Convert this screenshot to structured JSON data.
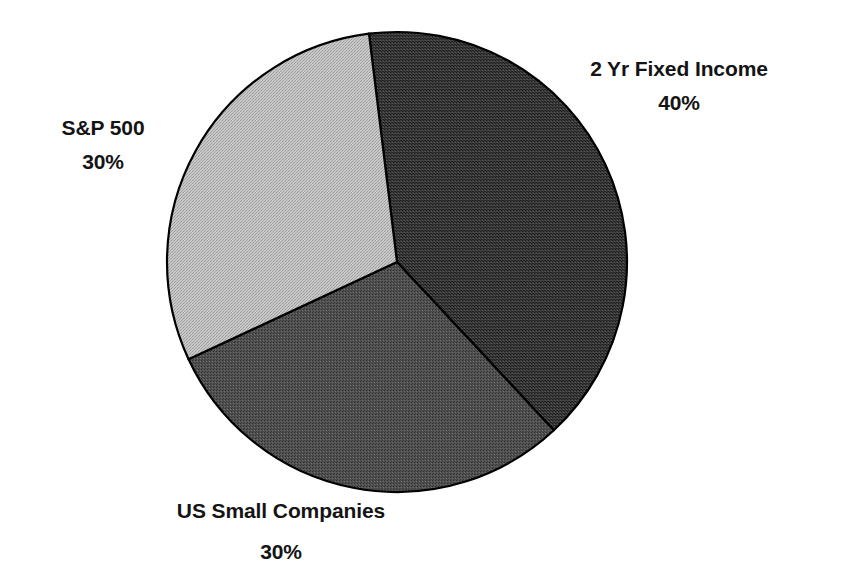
{
  "chart_data": {
    "type": "pie",
    "title": "",
    "subtitle": "",
    "xlabel": "",
    "ylabel": "",
    "legend_position": "none",
    "grid": false,
    "labels_outside": true,
    "units": "percent",
    "total": 100,
    "categories": [
      "2 Yr Fixed Income",
      "US Small Companies",
      "S&P 500"
    ],
    "values": [
      40,
      30,
      30
    ],
    "value_labels": [
      "40%",
      "30%",
      "30%"
    ],
    "slices": [
      {
        "name": "2 Yr Fixed Income",
        "value": 40,
        "value_label": "40%",
        "color": "#3a3a3a",
        "start_angle_deg": -7,
        "end_angle_deg": 137,
        "sweep_deg": 144,
        "label_position": "right"
      },
      {
        "name": "US Small Companies",
        "value": 30,
        "value_label": "30%",
        "color": "#4d4d4d",
        "start_angle_deg": 137,
        "end_angle_deg": 245,
        "sweep_deg": 108,
        "label_position": "bottom"
      },
      {
        "name": "S&P 500",
        "value": 30,
        "value_label": "30%",
        "color": "#bcbcbc",
        "start_angle_deg": 245,
        "end_angle_deg": 353,
        "sweep_deg": 108,
        "label_position": "left"
      }
    ],
    "geometry": {
      "center_x": 397,
      "center_y": 262,
      "radius": 230
    },
    "style": {
      "background": "#ffffff",
      "outline_color": "#000000",
      "outline_width": 2,
      "text_color": "#141414",
      "texture": "halftone-dither"
    }
  },
  "labels": {
    "fixed_income": {
      "name": "2 Yr Fixed Income",
      "value": "40%"
    },
    "sp500": {
      "name": "S&P 500",
      "value": "30%"
    },
    "us_small": {
      "name": "US Small Companies",
      "value": "30%"
    }
  }
}
